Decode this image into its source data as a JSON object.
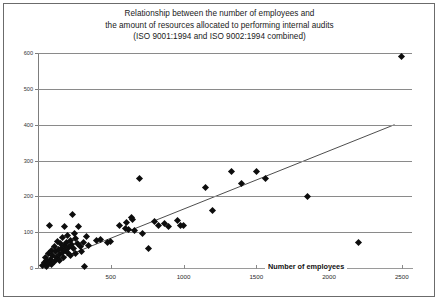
{
  "figure": {
    "title_lines": [
      "Relationship between the number of employees and",
      "the amount of resources allocated to performing internal audits",
      "(ISO 9001:1994 and ISO 9002:1994 combined)"
    ]
  },
  "chart_data": {
    "type": "scatter",
    "title": "Relationship between the number of employees and the amount of resources allocated to performing internal audits (ISO 9001:1994 and ISO 9002:1994 combined)",
    "xlabel": "Number of employees",
    "ylabel": "Number of persons x days",
    "xlim": [
      0,
      2570
    ],
    "ylim": [
      0,
      600
    ],
    "xticks": [
      0,
      500,
      1000,
      1500,
      2000,
      2500
    ],
    "xtick_labels": [
      "",
      "500",
      "1000",
      "1500",
      "2000",
      "2500"
    ],
    "yticks": [
      0,
      100,
      200,
      300,
      400,
      500,
      600
    ],
    "ytick_labels": [
      "0",
      "100",
      "200",
      "300",
      "400",
      "500",
      "600"
    ],
    "grid": "horizontal",
    "legend": "none",
    "points": [
      [
        30,
        8
      ],
      [
        45,
        15
      ],
      [
        50,
        30
      ],
      [
        55,
        5
      ],
      [
        60,
        22
      ],
      [
        70,
        12
      ],
      [
        75,
        40
      ],
      [
        80,
        120
      ],
      [
        85,
        25
      ],
      [
        90,
        10
      ],
      [
        95,
        48
      ],
      [
        100,
        35
      ],
      [
        110,
        18
      ],
      [
        115,
        60
      ],
      [
        120,
        45
      ],
      [
        130,
        28
      ],
      [
        135,
        75
      ],
      [
        140,
        52
      ],
      [
        145,
        38
      ],
      [
        150,
        20
      ],
      [
        155,
        68
      ],
      [
        160,
        55
      ],
      [
        165,
        42
      ],
      [
        170,
        85
      ],
      [
        175,
        30
      ],
      [
        180,
        115
      ],
      [
        185,
        62
      ],
      [
        190,
        50
      ],
      [
        195,
        72
      ],
      [
        200,
        44
      ],
      [
        205,
        90
      ],
      [
        210,
        58
      ],
      [
        220,
        35
      ],
      [
        225,
        78
      ],
      [
        230,
        65
      ],
      [
        240,
        148
      ],
      [
        245,
        55
      ],
      [
        250,
        95
      ],
      [
        255,
        40
      ],
      [
        260,
        82
      ],
      [
        270,
        68
      ],
      [
        280,
        115
      ],
      [
        290,
        60
      ],
      [
        300,
        45
      ],
      [
        310,
        72
      ],
      [
        320,
        5
      ],
      [
        330,
        88
      ],
      [
        350,
        62
      ],
      [
        400,
        78
      ],
      [
        430,
        80
      ],
      [
        480,
        72
      ],
      [
        500,
        75
      ],
      [
        560,
        120
      ],
      [
        600,
        110
      ],
      [
        610,
        128
      ],
      [
        620,
        108
      ],
      [
        640,
        140
      ],
      [
        650,
        135
      ],
      [
        660,
        105
      ],
      [
        700,
        250
      ],
      [
        720,
        95
      ],
      [
        760,
        55
      ],
      [
        800,
        130
      ],
      [
        830,
        120
      ],
      [
        870,
        125
      ],
      [
        900,
        115
      ],
      [
        960,
        132
      ],
      [
        980,
        120
      ],
      [
        1000,
        118
      ],
      [
        1150,
        225
      ],
      [
        1200,
        160
      ],
      [
        1330,
        270
      ],
      [
        1400,
        235
      ],
      [
        1500,
        270
      ],
      [
        1560,
        250
      ],
      [
        1850,
        200
      ],
      [
        2200,
        70
      ],
      [
        2500,
        590
      ]
    ],
    "trendline": {
      "from": [
        20,
        5
      ],
      "to": [
        2450,
        400
      ]
    }
  }
}
